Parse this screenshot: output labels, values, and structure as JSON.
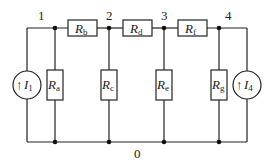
{
  "diagram": {
    "type": "circuit",
    "nodes": [
      {
        "id": "1",
        "label": "1"
      },
      {
        "id": "2",
        "label": "2"
      },
      {
        "id": "3",
        "label": "3"
      },
      {
        "id": "4",
        "label": "4"
      },
      {
        "id": "0",
        "label": "0"
      }
    ],
    "resistors": [
      {
        "id": "Ra",
        "main": "R",
        "sub": "a",
        "from": "1",
        "to": "0"
      },
      {
        "id": "Rb",
        "main": "R",
        "sub": "b",
        "from": "1",
        "to": "2"
      },
      {
        "id": "Rc",
        "main": "R",
        "sub": "c",
        "from": "2",
        "to": "0"
      },
      {
        "id": "Rd",
        "main": "R",
        "sub": "d",
        "from": "2",
        "to": "3"
      },
      {
        "id": "Re",
        "main": "R",
        "sub": "e",
        "from": "3",
        "to": "0"
      },
      {
        "id": "Rf",
        "main": "R",
        "sub": "f",
        "from": "3",
        "to": "4"
      },
      {
        "id": "Rg",
        "main": "R",
        "sub": "g",
        "from": "4",
        "to": "0"
      }
    ],
    "sources": [
      {
        "id": "I1",
        "arrow": "↑",
        "main": "I",
        "sub": "1",
        "from": "0",
        "to": "1"
      },
      {
        "id": "I4",
        "arrow": "↑",
        "main": "I",
        "sub": "4",
        "from": "0",
        "to": "4"
      }
    ]
  }
}
